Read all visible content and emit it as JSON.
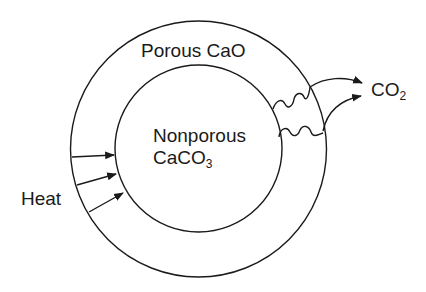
{
  "diagram": {
    "type": "shrinking-core calcination schematic",
    "regions": {
      "outer_shell": {
        "label": "Porous CaO"
      },
      "inner_core": {
        "label_line1": "Nonporous",
        "label_line2_main": "CaCO",
        "label_line2_sub": "3"
      }
    },
    "inputs": {
      "heat": {
        "label": "Heat",
        "arrow_count": 3
      }
    },
    "outputs": {
      "gas": {
        "label_main": "CO",
        "label_sub": "2",
        "arrow_count": 2,
        "diffusion_paths": 2
      }
    },
    "colors": {
      "line": "#1a1a1a",
      "background": "#ffffff"
    }
  }
}
